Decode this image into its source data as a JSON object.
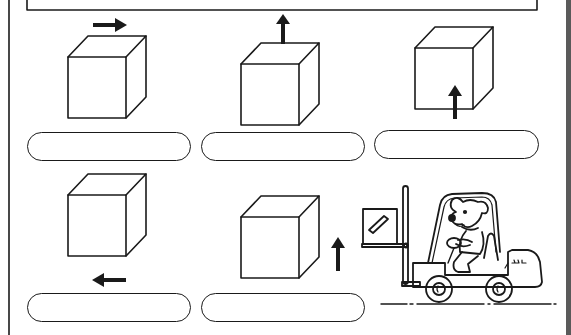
{
  "worksheet": {
    "title_box": {
      "text": ""
    },
    "items": [
      {
        "id": 1,
        "cube": "cube",
        "arrow_direction": "right",
        "arrow_position": "above-cube",
        "answer": ""
      },
      {
        "id": 2,
        "cube": "cube",
        "arrow_direction": "up",
        "arrow_position": "on-top-of-cube",
        "answer": ""
      },
      {
        "id": 3,
        "cube": "cube",
        "arrow_direction": "up",
        "arrow_position": "below-inside-cube",
        "answer": ""
      },
      {
        "id": 4,
        "cube": "cube",
        "arrow_direction": "left",
        "arrow_position": "below-cube",
        "answer": ""
      },
      {
        "id": 5,
        "cube": "cube",
        "arrow_direction": "up",
        "arrow_position": "right-of-cube",
        "answer": ""
      }
    ],
    "illustration": {
      "subject": "dog-driving-forklift",
      "description": "Cartoon dog driving a forklift carrying a box"
    },
    "colors": {
      "ink": "#1a1a1a",
      "paper": "#ffffff",
      "edge": "#5a5a5a"
    }
  }
}
